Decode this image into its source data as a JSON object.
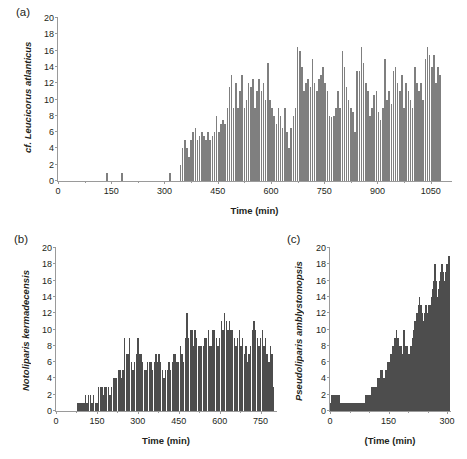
{
  "figure": {
    "background": "#ffffff",
    "bar_color": "#7f7f7f",
    "bar_color_dark": "#4d4d4d",
    "axis_color": "#9a9a9a",
    "text_color": "#231f20"
  },
  "panels": {
    "a": {
      "tag": "(a)",
      "ylabel": "cf. Leucicorus atlanticus",
      "xlabel": "Time (min)"
    },
    "b": {
      "tag": "(b)",
      "ylabel": "Notoliparis kermadecensis",
      "xlabel": "Time (min)"
    },
    "c": {
      "tag": "(c)",
      "ylabel": "Pseudoliparis amblystomopsis",
      "xlabel": "(Time (min)"
    }
  },
  "chart_data": [
    {
      "type": "bar",
      "panel": "a",
      "title": "",
      "xlabel": "Time (min)",
      "ylabel": "cf. Leucicorus atlanticus",
      "xlim": [
        0,
        1110
      ],
      "ylim": [
        0,
        20
      ],
      "yticks": [
        0,
        2,
        4,
        6,
        8,
        10,
        12,
        14,
        16,
        18,
        20
      ],
      "xticks": [
        0,
        150,
        300,
        450,
        600,
        750,
        900,
        1050
      ],
      "xminorticks": [
        75,
        225,
        375,
        525,
        675,
        825,
        975,
        1125
      ],
      "grid": false,
      "legend": null,
      "bin_width": 6,
      "x": [
        138,
        180,
        315,
        345,
        351,
        357,
        363,
        369,
        375,
        381,
        387,
        393,
        399,
        405,
        411,
        417,
        423,
        429,
        435,
        441,
        447,
        453,
        459,
        465,
        471,
        477,
        483,
        489,
        495,
        501,
        507,
        513,
        519,
        525,
        531,
        537,
        543,
        549,
        555,
        561,
        567,
        573,
        579,
        585,
        591,
        597,
        603,
        609,
        615,
        621,
        627,
        633,
        639,
        645,
        651,
        657,
        663,
        669,
        675,
        681,
        687,
        693,
        699,
        705,
        711,
        717,
        723,
        729,
        735,
        741,
        747,
        753,
        759,
        765,
        771,
        777,
        783,
        789,
        795,
        801,
        807,
        813,
        819,
        825,
        831,
        837,
        843,
        849,
        855,
        861,
        867,
        873,
        879,
        885,
        891,
        897,
        903,
        909,
        915,
        921,
        927,
        933,
        939,
        945,
        951,
        957,
        963,
        969,
        975,
        981,
        987,
        993,
        999,
        1005,
        1011,
        1017,
        1023,
        1029,
        1035,
        1041,
        1047,
        1053,
        1059,
        1065,
        1071,
        1077,
        1083,
        1089,
        1095,
        1101
      ],
      "values": [
        1,
        1,
        1,
        2,
        4,
        5,
        4,
        3,
        5,
        6,
        6.5,
        5,
        5.5,
        6,
        5.5,
        5,
        6,
        5,
        5.5,
        6,
        8,
        6,
        7,
        7.5,
        7,
        9,
        11.5,
        13,
        9,
        12,
        9,
        11,
        13,
        9,
        10,
        12,
        11.5,
        12.5,
        9,
        11,
        12.5,
        11,
        12,
        10,
        14.5,
        10,
        9,
        8,
        7,
        9,
        8,
        6.5,
        9,
        6,
        4,
        6.5,
        8,
        9,
        16.5,
        16,
        14,
        11,
        12,
        12.5,
        11.5,
        15,
        12,
        11,
        12.5,
        13,
        14,
        12,
        11,
        8,
        7.8,
        8,
        9,
        11,
        9,
        16,
        14,
        11.5,
        10,
        9,
        8.5,
        6,
        13.5,
        13.5,
        16.5,
        14.5,
        12,
        11,
        8,
        9,
        10.5,
        11,
        8.5,
        7.5,
        9,
        15,
        10,
        11,
        9.5,
        13.5,
        14,
        12,
        11,
        13,
        9,
        12,
        11,
        10,
        9,
        14,
        12,
        11,
        12,
        10,
        15,
        16.5,
        15.5,
        14,
        15.5,
        12,
        14,
        13
      ]
    },
    {
      "type": "bar",
      "panel": "b",
      "title": "",
      "xlabel": "Time (min)",
      "ylabel": "Notoliparis kermadecensis",
      "xlim": [
        0,
        810
      ],
      "ylim": [
        0,
        20
      ],
      "yticks": [
        0,
        2,
        4,
        6,
        8,
        10,
        12,
        14,
        16,
        18,
        20
      ],
      "xticks": [
        0,
        150,
        300,
        450,
        600,
        750
      ],
      "xminorticks": [
        75,
        225,
        375,
        525,
        675,
        825
      ],
      "grid": false,
      "legend": null,
      "bin_width": 6,
      "x": [
        78,
        84,
        90,
        96,
        102,
        108,
        114,
        120,
        126,
        132,
        138,
        144,
        150,
        156,
        162,
        168,
        174,
        180,
        186,
        192,
        198,
        204,
        210,
        216,
        222,
        228,
        234,
        240,
        246,
        252,
        258,
        264,
        270,
        276,
        282,
        288,
        294,
        300,
        306,
        312,
        318,
        324,
        330,
        336,
        342,
        348,
        354,
        360,
        366,
        372,
        378,
        384,
        390,
        396,
        402,
        408,
        414,
        420,
        426,
        432,
        438,
        444,
        450,
        456,
        462,
        468,
        474,
        480,
        486,
        492,
        498,
        504,
        510,
        516,
        522,
        528,
        534,
        540,
        546,
        552,
        558,
        564,
        570,
        576,
        582,
        588,
        594,
        600,
        606,
        612,
        618,
        624,
        630,
        636,
        642,
        648,
        654,
        660,
        666,
        672,
        678,
        684,
        690,
        696,
        702,
        708,
        714,
        720,
        726,
        732,
        738,
        744,
        750,
        756,
        762,
        768,
        774,
        780,
        786,
        792,
        798
      ],
      "values": [
        1,
        1,
        1,
        1,
        1,
        2,
        1,
        2,
        2,
        1,
        2,
        1,
        1,
        3,
        3,
        3,
        2,
        3,
        3,
        3,
        2,
        3,
        4,
        4,
        4,
        5,
        5,
        4,
        5,
        9,
        7,
        7,
        9,
        6,
        5,
        6,
        7,
        9,
        7,
        7,
        6,
        5,
        5,
        6,
        6,
        6,
        5,
        6,
        7,
        6,
        7,
        6,
        5,
        4,
        5,
        5,
        6,
        5,
        6,
        7,
        7,
        6,
        6,
        8,
        7,
        6,
        9,
        12,
        9,
        10,
        10,
        8,
        10,
        9,
        8,
        8,
        8,
        8,
        9,
        9,
        10,
        8,
        8,
        10,
        10,
        9,
        8,
        9,
        11,
        10,
        12,
        11,
        10,
        11,
        10,
        10,
        9,
        8,
        9,
        10,
        8,
        9,
        7,
        8,
        6,
        7,
        8,
        10,
        11,
        10,
        9,
        8,
        9,
        10,
        8,
        9,
        7,
        6,
        8,
        7,
        3,
        3
      ]
    },
    {
      "type": "bar",
      "panel": "c",
      "title": "",
      "xlabel": "(Time (min)",
      "ylabel": "Pseudoliparis amblystomopsis",
      "xlim": [
        0,
        310
      ],
      "ylim": [
        0,
        20
      ],
      "yticks": [
        0,
        2,
        4,
        6,
        8,
        10,
        12,
        14,
        16,
        18,
        20
      ],
      "xticks": [
        0,
        150,
        300
      ],
      "xminorticks": [
        50,
        100,
        200,
        250
      ],
      "grid": false,
      "legend": null,
      "bin_width": 3,
      "x": [
        2,
        5,
        8,
        11,
        14,
        17,
        20,
        23,
        26,
        29,
        32,
        35,
        38,
        41,
        44,
        47,
        50,
        53,
        56,
        59,
        62,
        65,
        68,
        71,
        74,
        77,
        80,
        83,
        86,
        89,
        92,
        95,
        98,
        101,
        104,
        107,
        110,
        113,
        116,
        119,
        122,
        125,
        128,
        131,
        134,
        137,
        140,
        143,
        146,
        149,
        152,
        155,
        158,
        161,
        164,
        167,
        170,
        173,
        176,
        179,
        182,
        185,
        188,
        191,
        194,
        197,
        200,
        203,
        206,
        209,
        212,
        215,
        218,
        221,
        224,
        227,
        230,
        233,
        236,
        239,
        242,
        245,
        248,
        251,
        254,
        257,
        260,
        263,
        266,
        269,
        272,
        275,
        278,
        281,
        284,
        287,
        290,
        293,
        296,
        299,
        302,
        305
      ],
      "values": [
        1,
        2,
        2,
        2,
        2,
        2,
        2,
        2,
        1,
        1,
        1,
        1,
        1,
        1,
        1,
        1,
        1,
        1,
        1,
        1,
        1,
        1,
        1,
        1,
        1,
        1,
        1,
        1,
        1,
        1,
        2,
        2,
        2,
        2,
        2,
        3,
        3,
        3,
        3,
        3,
        4,
        4,
        4,
        5,
        5,
        4,
        4,
        5,
        5,
        6,
        6,
        7,
        7,
        8,
        8,
        9,
        10,
        9,
        9,
        8,
        8,
        7,
        10,
        10,
        8,
        8,
        7,
        7,
        8,
        8,
        9,
        10,
        11,
        12,
        12,
        13,
        14,
        13,
        12,
        11,
        12,
        13,
        13,
        12,
        13,
        13,
        14,
        15,
        16,
        18,
        16,
        14,
        15,
        16,
        17,
        18,
        17,
        16,
        17,
        18,
        18,
        19
      ]
    }
  ]
}
